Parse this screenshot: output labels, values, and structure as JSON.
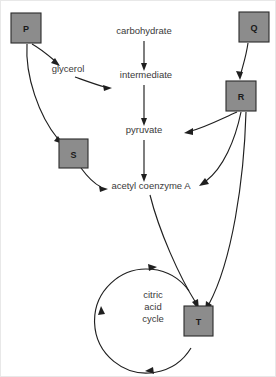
{
  "diagram": {
    "background_color": "#ffffff",
    "box_fill_color": "#8c8c8c",
    "line_color": "#1f1f1f",
    "text_color": "#3a3a3a",
    "metabolites": [
      {
        "id": "carbohydrate",
        "label": "carbohydrate",
        "x": 143,
        "y": 33
      },
      {
        "id": "glycerol",
        "label": "glycerol",
        "x": 67,
        "y": 71
      },
      {
        "id": "intermediate",
        "label": "intermediate",
        "x": 145,
        "y": 77
      },
      {
        "id": "pyruvate",
        "label": "pyruvate",
        "x": 143,
        "y": 132
      },
      {
        "id": "acetyl-coenzyme-a",
        "label": "acetyl coenzyme A",
        "x": 150,
        "y": 188
      }
    ],
    "boxes": [
      {
        "id": "P",
        "label": "P",
        "x": 10,
        "y": 12,
        "width": 30,
        "height": 30
      },
      {
        "id": "Q",
        "label": "Q",
        "x": 238,
        "y": 11,
        "width": 30,
        "height": 30
      },
      {
        "id": "R",
        "label": "R",
        "x": 225,
        "y": 80,
        "width": 30,
        "height": 30
      },
      {
        "id": "S",
        "label": "S",
        "x": 58,
        "y": 138,
        "width": 29,
        "height": 29
      },
      {
        "id": "T",
        "label": "T",
        "x": 183,
        "y": 305,
        "width": 29,
        "height": 30
      }
    ],
    "cycle": {
      "id": "citric-acid-cycle",
      "lines": [
        "citric",
        "acid",
        "cycle"
      ],
      "center_x": 152,
      "center_y": 318,
      "radius": 52,
      "direction": "clockwise"
    },
    "arrows": [
      {
        "id": "carbohydrate-to-intermediate",
        "from": "carbohydrate",
        "to": "intermediate"
      },
      {
        "id": "intermediate-to-pyruvate",
        "from": "intermediate",
        "to": "pyruvate"
      },
      {
        "id": "pyruvate-to-acetyl-coenzyme-a",
        "from": "pyruvate",
        "to": "acetyl-coenzyme-a"
      },
      {
        "id": "p-to-glycerol",
        "from": "P",
        "to": "glycerol"
      },
      {
        "id": "glycerol-to-intermediate",
        "from": "glycerol",
        "to": "intermediate"
      },
      {
        "id": "p-to-s",
        "from": "P",
        "to": "S"
      },
      {
        "id": "s-to-acetyl-coenzyme-a",
        "from": "S",
        "to": "acetyl-coenzyme-a"
      },
      {
        "id": "q-to-r",
        "from": "Q",
        "to": "R"
      },
      {
        "id": "r-to-pyruvate",
        "from": "R",
        "to": "pyruvate"
      },
      {
        "id": "r-to-acetyl-coenzyme-a",
        "from": "R",
        "to": "acetyl-coenzyme-a"
      },
      {
        "id": "r-to-t",
        "from": "R",
        "to": "T"
      },
      {
        "id": "acetyl-coenzyme-a-to-t",
        "from": "acetyl-coenzyme-a",
        "to": "T"
      }
    ]
  }
}
